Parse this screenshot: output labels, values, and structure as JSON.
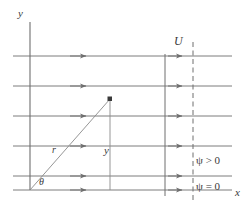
{
  "figure": {
    "background_color": "#ffffff",
    "line_color": "#6e6e6e",
    "text_color": "#3a3a3a",
    "width": 250,
    "height": 213
  },
  "axes": {
    "y_axis": {
      "label": "y",
      "x": 30,
      "y_top": 22,
      "y_bottom": 190
    },
    "x_axis": {
      "label": "x",
      "y": 190,
      "x_left": 13,
      "x_right": 232
    }
  },
  "streamlines": {
    "count": 6,
    "y_positions": [
      56,
      86,
      116,
      146,
      176,
      190
    ],
    "x_start": 13,
    "x_end": 232,
    "arrow_x_positions": [
      85,
      180
    ],
    "label": "U",
    "velocity_label": "U"
  },
  "vertical_markers": {
    "solid_line": {
      "x": 165,
      "y_top": 56,
      "y_bottom": 196,
      "style": "solid"
    },
    "dashed_line": {
      "x": 193,
      "y_top": 42,
      "y_bottom": 200,
      "style": "dashed"
    }
  },
  "polar_point": {
    "origin_x": 30,
    "origin_y": 190,
    "point_x": 110,
    "point_y": 99,
    "radius_label": "r",
    "angle_label": "θ",
    "height_label": "y",
    "marker": "point-dot"
  },
  "stream_function_labels": {
    "positive": {
      "symbol": "ψ",
      "relation": " > 0",
      "full": "ψ > 0"
    },
    "zero": {
      "symbol": "ψ",
      "relation": " = 0",
      "full": "ψ = 0"
    }
  }
}
